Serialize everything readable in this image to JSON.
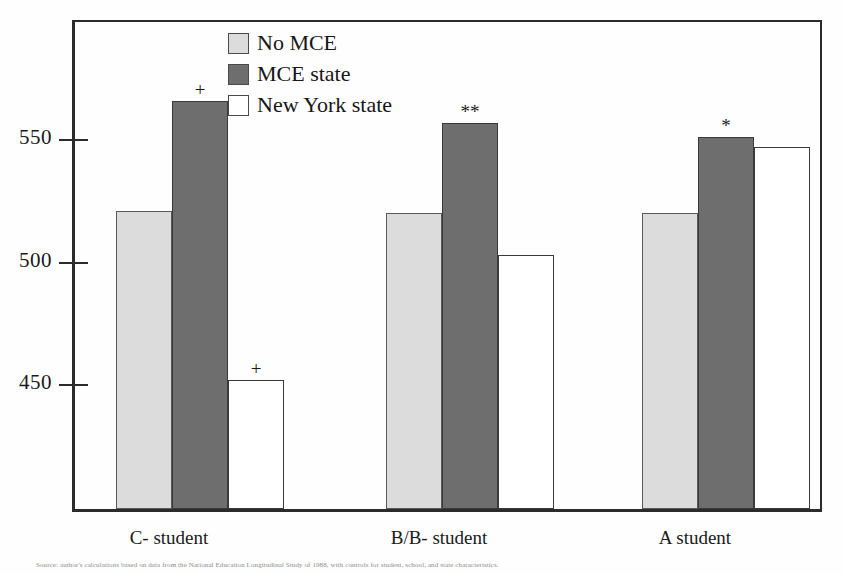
{
  "chart_data": {
    "type": "bar",
    "title": "",
    "subtitle": "",
    "xlabel": "",
    "ylabel": "",
    "categories": [
      "C- student",
      "B/B- student",
      "A student"
    ],
    "series": [
      {
        "name": "No MCE",
        "key": "nomce",
        "color": "#dcdcdc",
        "values": [
          519,
          518,
          518
        ]
      },
      {
        "name": "MCE state",
        "key": "mce",
        "color": "#6e6e6e",
        "values": [
          564,
          555,
          549
        ]
      },
      {
        "name": "New York state",
        "key": "ny",
        "color": "#ffffff",
        "values": [
          450,
          501,
          545
        ]
      }
    ],
    "annotations": [
      {
        "group": 0,
        "series": 1,
        "text": "+"
      },
      {
        "group": 0,
        "series": 2,
        "text": "+"
      },
      {
        "group": 1,
        "series": 1,
        "text": "**"
      },
      {
        "group": 2,
        "series": 1,
        "text": "*"
      }
    ],
    "yticks": [
      550,
      500,
      450
    ],
    "ylim": [
      420,
      580
    ],
    "grid": false,
    "legend_position": "top-center"
  },
  "axis": {
    "tick_labels": [
      "550",
      "500",
      "450"
    ]
  },
  "legend": {
    "items": [
      {
        "label": "No MCE"
      },
      {
        "label": "MCE state"
      },
      {
        "label": "New York state"
      }
    ]
  },
  "xaxis": {
    "labels": [
      "C- student",
      "B/B- student",
      "A student"
    ]
  },
  "caption": {
    "text": "Source: author's calculations based on data from the National Education Longitudinal Study of 1988, with controls for student, school, and state characteristics."
  }
}
